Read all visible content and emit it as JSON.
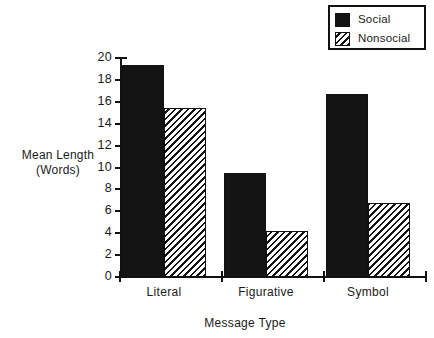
{
  "chart_data": {
    "type": "bar",
    "title": "",
    "xlabel": "Message Type",
    "ylabel_line1": "Mean Length",
    "ylabel_line2": "(Words)",
    "categories": [
      "Literal",
      "Figurative",
      "Symbol"
    ],
    "series": [
      {
        "name": "Social",
        "values": [
          19.4,
          9.5,
          16.7
        ],
        "fill": "solid",
        "color": "#141414"
      },
      {
        "name": "Nonsocial",
        "values": [
          15.4,
          4.2,
          6.8
        ],
        "fill": "hatch-diagonal",
        "color": "#141414"
      }
    ],
    "ylim": [
      0,
      20
    ],
    "ytick_labels": [
      "0",
      "2",
      "4",
      "6",
      "8",
      "10",
      "12",
      "14",
      "16",
      "18",
      "20"
    ],
    "ytick_values": [
      0,
      2,
      4,
      6,
      8,
      10,
      12,
      14,
      16,
      18,
      20
    ],
    "grid": false,
    "legend_position": "top-right",
    "legend_entries": [
      "Social",
      "Nonsocial"
    ]
  },
  "legend": {
    "items": [
      {
        "label": "Social",
        "swatch": "solid-black-swatch"
      },
      {
        "label": "Nonsocial",
        "swatch": "diagonal-hatch-swatch"
      }
    ]
  },
  "axes": {
    "x_title": "Message Type",
    "y_title_line1": "Mean Length",
    "y_title_line2": "(Words)"
  }
}
